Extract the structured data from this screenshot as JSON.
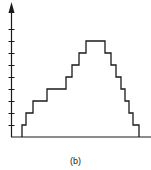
{
  "chart_data": {
    "type": "line",
    "subtype": "step",
    "title": "",
    "caption": "(b)",
    "xlabel": "",
    "ylabel": "",
    "y_ticks": 9,
    "ylim": [
      0,
      9
    ],
    "grid": false,
    "legend": null,
    "steps": [
      {
        "x": 22,
        "level": 1
      },
      {
        "x": 26,
        "level": 2
      },
      {
        "x": 33,
        "level": 3
      },
      {
        "x": 47,
        "level": 4
      },
      {
        "x": 66,
        "level": 5
      },
      {
        "x": 72,
        "level": 6
      },
      {
        "x": 79,
        "level": 7
      },
      {
        "x": 86,
        "level": 8
      },
      {
        "x": 105,
        "level": 7
      },
      {
        "x": 111,
        "level": 6
      },
      {
        "x": 116,
        "level": 5
      },
      {
        "x": 121,
        "level": 4
      },
      {
        "x": 125,
        "level": 3
      },
      {
        "x": 129,
        "level": 2
      },
      {
        "x": 133,
        "level": 1
      },
      {
        "x": 139,
        "level": 0
      }
    ],
    "values": [
      0,
      1,
      2,
      3,
      4,
      5,
      6,
      7,
      8,
      7,
      6,
      5,
      4,
      3,
      2,
      1,
      0
    ]
  },
  "colors": {
    "line": "#1a1a1a",
    "background": "#ffffff"
  }
}
